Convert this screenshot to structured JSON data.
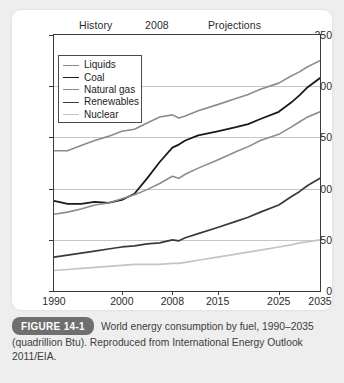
{
  "figure": {
    "badge": "FIGURE 14-1",
    "caption": "World energy consumption by fuel, 1990–2035 (quadrillion Btu). Reproduced from International Energy Outlook 2011/EIA."
  },
  "era_labels": {
    "history": "History",
    "divider_year": "2008",
    "projections": "Projections"
  },
  "colors": {
    "liquids": "#8c8c8c",
    "coal": "#1a1a1a",
    "natural_gas": "#8c8c8c",
    "renewables": "#3a3a3a",
    "nuclear": "#c4c4c4",
    "grid": "#c6c6c6",
    "axis": "#3a3a3a",
    "badge_bg": "#6f6f6f",
    "page_bg": "#eeeeee",
    "card_bg": "#ffffff"
  },
  "chart_data": {
    "type": "line",
    "title": "World energy consumption by fuel, 1990–2035 (quadrillion Btu)",
    "xlabel": "",
    "ylabel": "",
    "xlim": [
      1990,
      2035
    ],
    "ylim": [
      0,
      250
    ],
    "grid": true,
    "legend_position": "upper-left",
    "y_ticks": [
      0,
      50,
      100,
      150,
      200,
      250
    ],
    "x_ticks": [
      1990,
      2000,
      2008,
      2015,
      2025,
      2035
    ],
    "x_tick_labels": [
      "1990",
      "2000",
      "2008",
      "2015",
      "2025",
      "2035"
    ],
    "y_tick_labels": [
      "0",
      "50",
      "100",
      "150",
      "200",
      "250"
    ],
    "annotations": [
      "History",
      "2008",
      "Projections"
    ],
    "x": [
      1990,
      1992,
      1994,
      1996,
      1998,
      2000,
      2002,
      2004,
      2006,
      2008,
      2009,
      2010,
      2012,
      2015,
      2018,
      2020,
      2022,
      2025,
      2028,
      2030,
      2032,
      2035
    ],
    "series": [
      {
        "name": "Liquids",
        "color": "#8c8c8c",
        "width": 1.6,
        "values": [
          137,
          137,
          142,
          147,
          151,
          156,
          158,
          164,
          170,
          172,
          169,
          171,
          176,
          182,
          188,
          192,
          197,
          203,
          210,
          214,
          219,
          225
        ]
      },
      {
        "name": "Coal",
        "color": "#1a1a1a",
        "width": 1.8,
        "values": [
          88,
          85,
          85,
          87,
          86,
          89,
          95,
          110,
          126,
          140,
          143,
          147,
          152,
          156,
          160,
          163,
          168,
          175,
          184,
          191,
          199,
          208
        ]
      },
      {
        "name": "Natural gas",
        "color": "#8c8c8c",
        "width": 1.6,
        "values": [
          75,
          77,
          80,
          84,
          86,
          90,
          94,
          99,
          105,
          112,
          110,
          114,
          120,
          128,
          136,
          141,
          147,
          153,
          160,
          165,
          170,
          175
        ]
      },
      {
        "name": "Renewables",
        "color": "#3a3a3a",
        "width": 1.7,
        "values": [
          33,
          35,
          37,
          39,
          41,
          43,
          44,
          46,
          47,
          50,
          49,
          52,
          56,
          62,
          68,
          72,
          77,
          84,
          92,
          97,
          103,
          110
        ]
      },
      {
        "name": "Nuclear",
        "color": "#c4c4c4",
        "width": 1.7,
        "values": [
          20,
          21,
          22,
          23,
          24,
          25,
          26,
          26,
          26,
          27,
          27,
          28,
          30,
          33,
          36,
          38,
          40,
          43,
          45,
          47,
          48,
          50
        ]
      }
    ]
  }
}
